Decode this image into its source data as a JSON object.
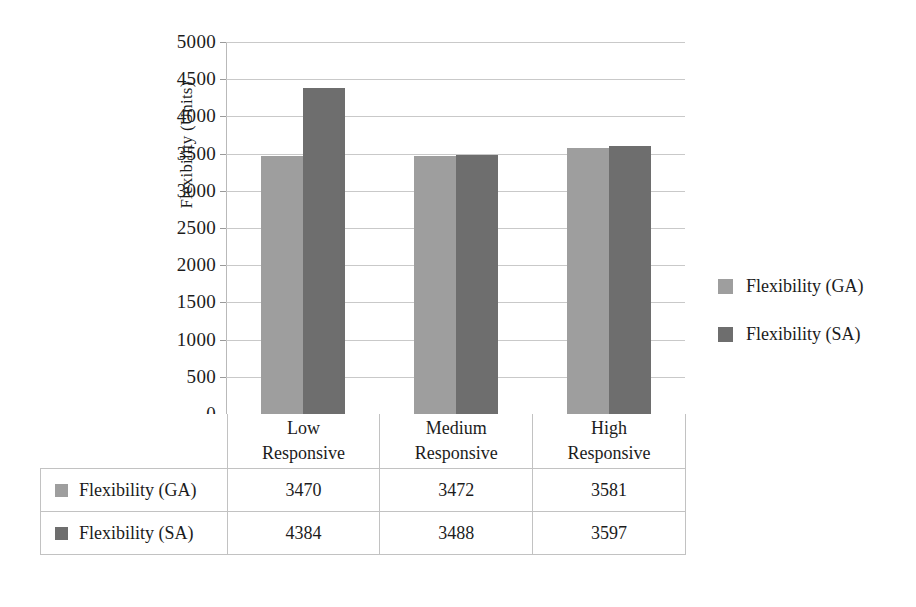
{
  "chart_data": {
    "type": "bar",
    "title": "",
    "xlabel": "",
    "ylabel": "Flexibility (Units)",
    "categories": [
      "Low Responsive",
      "Medium Responsive",
      "High Responsive"
    ],
    "category_lines": [
      [
        "Low",
        "Responsive"
      ],
      [
        "Medium",
        "Responsive"
      ],
      [
        "High",
        "Responsive"
      ]
    ],
    "series": [
      {
        "name": "Flexibility (GA)",
        "color": "#9e9e9e",
        "values": [
          3470,
          3472,
          3581
        ]
      },
      {
        "name": "Flexibility (SA)",
        "color": "#6e6e6e",
        "values": [
          4384,
          3488,
          3597
        ]
      }
    ],
    "ylim": [
      0,
      5000
    ],
    "ytick_step": 500,
    "yticks": [
      5000,
      4500,
      4000,
      3500,
      3000,
      2500,
      2000,
      1500,
      1000,
      500,
      0
    ],
    "ytick_labels": [
      "5000",
      "4500",
      "4000",
      "3500",
      "3000",
      "2500",
      "2000",
      "1500",
      "1000",
      "500",
      "0"
    ],
    "grid": true,
    "legend_position": "right",
    "has_data_table": true
  },
  "legend": {
    "items": [
      {
        "label": "Flexibility (GA)",
        "color": "#9e9e9e"
      },
      {
        "label": "Flexibility (SA)",
        "color": "#6e6e6e"
      }
    ]
  },
  "table": {
    "corner_label": "",
    "column_headers": [
      "Low Responsive",
      "Medium Responsive",
      "High Responsive"
    ],
    "rows": [
      {
        "series": "Flexibility (GA)",
        "color": "#9e9e9e",
        "cells": [
          "3470",
          "3472",
          "3581"
        ]
      },
      {
        "series": "Flexibility (SA)",
        "color": "#6e6e6e",
        "cells": [
          "4384",
          "3488",
          "3597"
        ]
      }
    ]
  },
  "colors": {
    "series_ga": "#9e9e9e",
    "series_sa": "#6e6e6e",
    "gridline": "#c9c9c9",
    "axis": "#b9b9b9",
    "text": "#1c1c1c",
    "background": "#ffffff"
  }
}
